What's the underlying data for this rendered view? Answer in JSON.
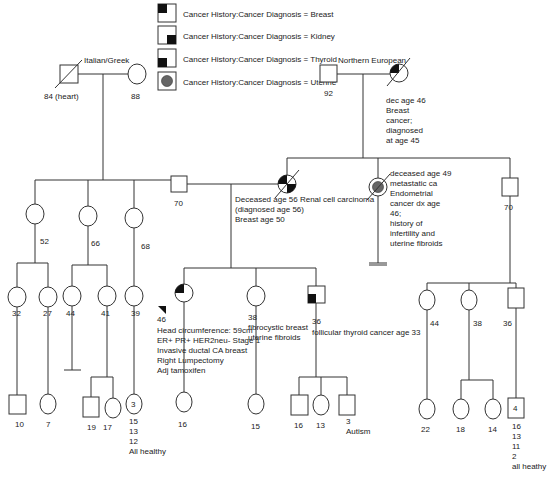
{
  "legend": {
    "items": [
      {
        "id": "breast",
        "label": "Cancer History:Cancer Diagnosis = Breast",
        "marker": "top-left-black-quadrant"
      },
      {
        "id": "kidney",
        "label": "Cancer History:Cancer Diagnosis = Kidney",
        "marker": "bottom-right-black-quadrant"
      },
      {
        "id": "thyroid",
        "label": "Cancer History:Cancer Diagnosis = Thyroid",
        "marker": "bottom-left-black-quadrant"
      },
      {
        "id": "uterine",
        "label": "Cancer History:Cancer Diagnosis = Uterine",
        "marker": "center-gray-dot"
      }
    ]
  },
  "colors": {
    "line": "#333333",
    "affected": "#111111",
    "uterine": "#666666"
  },
  "generation1": {
    "paternal": {
      "ethnicity": "Italian/Greek",
      "grandfather": {
        "label": "84 (heart)",
        "sex": "male",
        "deceased": true
      },
      "grandmother": {
        "label": "88",
        "sex": "female"
      }
    },
    "maternal": {
      "ethnicity": "Northern European",
      "grandfather": {
        "label": "92",
        "sex": "male"
      },
      "grandmother": {
        "sex": "female",
        "deceased": true,
        "conditions": [
          "breast"
        ],
        "note": [
          "dec age 46",
          "Breast",
          "cancer;",
          "diagnosed",
          "at age 45"
        ]
      }
    }
  },
  "generation2": {
    "paternal_siblings": [
      {
        "label": "52",
        "sex": "female"
      },
      {
        "label": "66",
        "sex": "female"
      },
      {
        "label": "68",
        "sex": "female"
      },
      {
        "label": "70",
        "sex": "male",
        "role": "father"
      }
    ],
    "mother": {
      "sex": "female",
      "deceased": true,
      "conditions": [
        "breast",
        "kidney"
      ],
      "note": [
        "Deceased age 56 Renal cell carcinoma",
        "(diagnosed age 56)",
        "Breast age 50"
      ]
    },
    "maternal_siblings": [
      {
        "sex": "female",
        "deceased": true,
        "conditions": [
          "uterine"
        ],
        "no_children": true,
        "note": [
          "deceased age 49",
          "metastatic ca",
          "Endometrial",
          "cancer dx age",
          "46;",
          "history of",
          "infertility and",
          "uterine fibroids"
        ]
      },
      {
        "label": "70",
        "sex": "male"
      }
    ]
  },
  "generation3": {
    "cousins_52": [
      {
        "label": "32",
        "sex": "female"
      },
      {
        "label": "27",
        "sex": "female"
      }
    ],
    "cousins_66": [
      {
        "label": "44",
        "sex": "female",
        "no_children": true
      },
      {
        "label": "41",
        "sex": "female"
      }
    ],
    "cousins_68": [
      {
        "label": "39",
        "sex": "female"
      }
    ],
    "siblings": [
      {
        "label": "46",
        "sex": "female",
        "proband": true,
        "conditions": [
          "breast"
        ],
        "note": [
          "Head circumference: 59cm",
          "ER+ PR+ HER2neu- Stage 1",
          "Invasive ductal CA breast",
          "Right Lumpectomy",
          "Adj tamoxifen"
        ]
      },
      {
        "label": "38",
        "sex": "female",
        "note": [
          "fibrocystic breast",
          "uterine fibroids"
        ]
      },
      {
        "label": "36",
        "sex": "male",
        "conditions": [
          "thyroid"
        ],
        "note": [
          "follicular thyroid cancer age 33"
        ]
      }
    ],
    "cousins_70": [
      {
        "label": "44",
        "sex": "female"
      },
      {
        "label": "38",
        "sex": "female"
      },
      {
        "label": "36",
        "sex": "male"
      }
    ]
  },
  "generation4": {
    "c32": [
      {
        "label": "10",
        "sex": "male"
      }
    ],
    "c27": [
      {
        "label": "7",
        "sex": "female"
      }
    ],
    "c41": [
      {
        "label": "19",
        "sex": "male"
      },
      {
        "label": "17",
        "sex": "female"
      }
    ],
    "c39": [
      {
        "count": "3",
        "sex": "female",
        "note": [
          "15",
          "13",
          "12",
          "All healthy"
        ]
      }
    ],
    "proband": [
      {
        "label": "16",
        "sex": "female"
      }
    ],
    "s38": [
      {
        "label": "15",
        "sex": "female"
      }
    ],
    "s36": [
      {
        "label": "16",
        "sex": "male"
      },
      {
        "label": "13",
        "sex": "female"
      },
      {
        "label": "3",
        "sex": "male",
        "note": [
          "Autism"
        ]
      }
    ],
    "c44": [
      {
        "label": "22",
        "sex": "female"
      }
    ],
    "c38": [
      {
        "label": "18",
        "sex": "female"
      },
      {
        "label": "14",
        "sex": "female"
      }
    ],
    "c36": [
      {
        "count": "4",
        "sex": "male",
        "note": [
          "16",
          "13",
          "11",
          "2",
          "all heathy"
        ]
      }
    ]
  }
}
